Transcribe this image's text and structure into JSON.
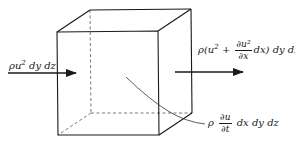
{
  "figure": {
    "inflow_label": {
      "rho": "ρu",
      "exp": "2",
      "rest": " dy dz"
    },
    "outflow_label": {
      "prefix": "ρ(u",
      "exp": "2",
      "plus": " + ",
      "frac_num": "∂u²",
      "frac_den": "∂x",
      "suffix": "dx) dy dz"
    },
    "storage_label": {
      "rho": "ρ",
      "frac_num": "∂u",
      "frac_den": "∂t",
      "suffix": "dx dy dz"
    },
    "colors": {
      "stroke": "#1a1a1a",
      "hidden_edge": "#555555",
      "background": "#ffffff"
    }
  }
}
